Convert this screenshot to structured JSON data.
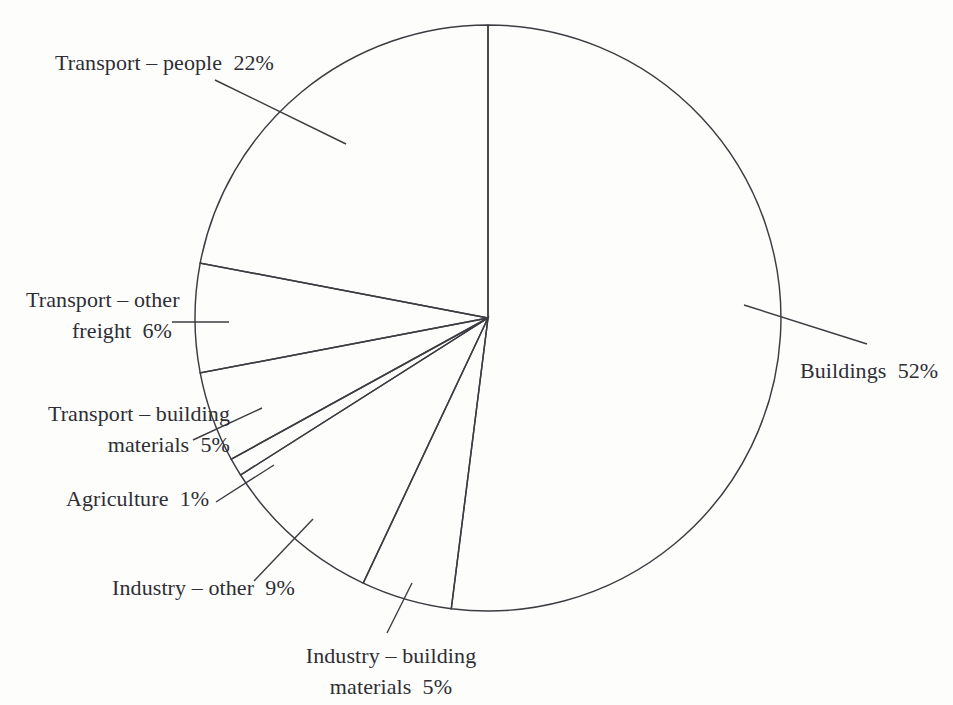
{
  "chart_data": {
    "type": "pie",
    "title": "",
    "subtitle": "",
    "xlabel": "",
    "ylabel": "",
    "legend_position": "none",
    "grid": false,
    "units": "percent",
    "total": 100,
    "start_angle_deg": 0,
    "direction": "counterclockwise",
    "categories": [
      "Buildings",
      "Transport – people",
      "Transport – other freight",
      "Transport – building materials",
      "Agriculture",
      "Industry – other",
      "Industry – building materials"
    ],
    "values": [
      52,
      22,
      6,
      5,
      1,
      9,
      5
    ],
    "slices": [
      {
        "name": "Buildings",
        "value": 52,
        "label": "Buildings  52%",
        "percent_text": "52%"
      },
      {
        "name": "Transport – people",
        "value": 22,
        "label": "Transport – people  22%",
        "percent_text": "22%"
      },
      {
        "name": "Transport – other freight",
        "value": 6,
        "label_line1": "Transport – other",
        "label_line2": "freight  6%",
        "percent_text": "6%"
      },
      {
        "name": "Transport – building materials",
        "value": 5,
        "label_line1": "Transport – building",
        "label_line2": "materials  5%",
        "percent_text": "5%"
      },
      {
        "name": "Agriculture",
        "value": 1,
        "label": "Agriculture  1%",
        "percent_text": "1%"
      },
      {
        "name": "Industry – other",
        "value": 9,
        "label": "Industry – other  9%",
        "percent_text": "9%"
      },
      {
        "name": "Industry – building materials",
        "value": 5,
        "label_line1": "Industry – building",
        "label_line2": "materials  5%",
        "percent_text": "5%"
      }
    ]
  },
  "style": {
    "background": "#fdfdfc",
    "stroke": "#3c3c42",
    "text": "#2e2e34"
  }
}
